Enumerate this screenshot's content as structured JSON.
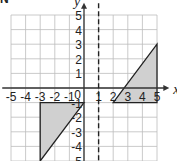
{
  "diagram": {
    "corner_label": "N",
    "x_axis_label": "x",
    "y_axis_label": "y",
    "x_ticks": [
      "-5",
      "-4",
      "-3",
      "-2",
      "-1",
      "1",
      "2",
      "3",
      "4",
      "5"
    ],
    "y_ticks": [
      "5",
      "4",
      "3",
      "2",
      "1",
      "-1",
      "-2",
      "-3",
      "-4",
      "-5"
    ],
    "origin_label": "0",
    "x_range": [
      -5,
      5
    ],
    "y_range": [
      -5,
      5
    ],
    "mirror_line": {
      "type": "dashed",
      "equation": "x = 1"
    },
    "shapes": [
      {
        "name": "triangle-left",
        "vertices": [
          [
            -3,
            -1
          ],
          [
            0,
            -1
          ],
          [
            -3,
            -5
          ]
        ],
        "fill": "#d0d0d0"
      },
      {
        "name": "triangle-right",
        "vertices": [
          [
            2,
            -1
          ],
          [
            5,
            -1
          ],
          [
            5,
            3
          ]
        ],
        "fill": "#d0d0d0"
      }
    ],
    "colors": {
      "grid": "#bdbdbd",
      "axis": "#333333",
      "shape_fill": "#d0d0d0",
      "shape_stroke": "#222222"
    }
  }
}
